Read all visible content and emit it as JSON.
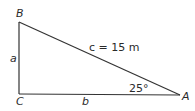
{
  "diagram": {
    "type": "right-triangle",
    "vertices": {
      "A": {
        "label": "A",
        "x": 180,
        "y": 95
      },
      "B": {
        "label": "B",
        "x": 19,
        "y": 22
      },
      "C": {
        "label": "C",
        "x": 19,
        "y": 94
      }
    },
    "sides": {
      "a": {
        "label": "a"
      },
      "b": {
        "label": "b"
      },
      "c": {
        "label": "c = 15 m",
        "value": 15,
        "unit": "m"
      }
    },
    "angle_A": {
      "label": "25°",
      "value": 25
    },
    "colors": {
      "stroke": "#333333",
      "text": "#2a2a2a",
      "background": "#ffffff"
    }
  }
}
